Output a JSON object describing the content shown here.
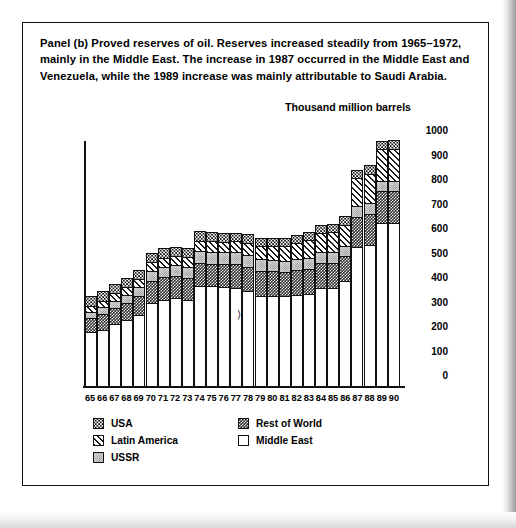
{
  "caption": "Panel (b)  Proved reserves of oil. Reserves increased steadily from 1965–1972, mainly in the Middle East. The increase in 1987 occurred in the Middle East and Venezuela, while the 1989 increase was mainly attributable to Saudi Arabia.",
  "axis_title": "Thousand million barrels",
  "legend": {
    "column1": [
      {
        "label": "USA",
        "pattern": "dots",
        "key": "usa"
      },
      {
        "label": "Latin America",
        "pattern": "diagonal-hatch",
        "key": "latin_america"
      },
      {
        "label": "USSR",
        "pattern": "light-stipple",
        "key": "ussr"
      }
    ],
    "column2": [
      {
        "label": "Rest of World",
        "pattern": "dark-checker",
        "key": "rest_of_world"
      },
      {
        "label": "Middle East",
        "pattern": "solid-white",
        "key": "middle_east"
      }
    ]
  },
  "chart_data": {
    "type": "bar",
    "stacked": true,
    "title": "Proved reserves of oil",
    "xlabel": "",
    "ylabel": "Thousand million barrels",
    "ylim": [
      0,
      1000
    ],
    "yticks": [
      0,
      100,
      200,
      300,
      400,
      500,
      600,
      700,
      800,
      900,
      1000
    ],
    "grid": false,
    "legend_position": "bottom",
    "categories": [
      "65",
      "66",
      "67",
      "68",
      "69",
      "70",
      "71",
      "72",
      "73",
      "74",
      "75",
      "76",
      "77",
      "78",
      "79",
      "80",
      "81",
      "82",
      "83",
      "84",
      "85",
      "86",
      "87",
      "88",
      "89",
      "90"
    ],
    "series": [
      {
        "name": "Middle East",
        "pattern": "solid-white",
        "values": [
          216,
          226,
          250,
          264,
          284,
          333,
          347,
          354,
          349,
          403,
          403,
          399,
          397,
          383,
          362,
          362,
          362,
          369,
          371,
          398,
          398,
          425,
          565,
          572,
          660,
          661
        ]
      },
      {
        "name": "Rest of World",
        "pattern": "dark-checker",
        "values": [
          56,
          62,
          64,
          72,
          81,
          90,
          92,
          90,
          88,
          93,
          91,
          93,
          95,
          100,
          105,
          103,
          100,
          99,
          102,
          99,
          99,
          101,
          122,
          128,
          131,
          130
        ]
      },
      {
        "name": "USSR",
        "pattern": "light-stipple",
        "values": [
          27,
          29,
          30,
          32,
          34,
          42,
          43,
          44,
          46,
          50,
          50,
          50,
          50,
          48,
          47,
          46,
          45,
          45,
          45,
          45,
          44,
          43,
          42,
          41,
          40,
          40
        ]
      },
      {
        "name": "Latin America",
        "pattern": "diagonal-hatch",
        "values": [
          25,
          27,
          30,
          32,
          33,
          36,
          38,
          38,
          40,
          42,
          43,
          43,
          45,
          50,
          55,
          58,
          62,
          65,
          72,
          78,
          82,
          85,
          115,
          122,
          133,
          134
        ]
      },
      {
        "name": "USA",
        "pattern": "dots",
        "values": [
          39,
          39,
          38,
          37,
          36,
          39,
          38,
          37,
          36,
          39,
          37,
          35,
          34,
          34,
          33,
          33,
          33,
          33,
          33,
          34,
          34,
          34,
          34,
          34,
          34,
          34
        ]
      }
    ],
    "totals": [
      363,
      383,
      412,
      437,
      468,
      540,
      558,
      563,
      559,
      627,
      624,
      620,
      621,
      615,
      602,
      602,
      602,
      611,
      623,
      654,
      657,
      688,
      878,
      897,
      998,
      999
    ]
  }
}
